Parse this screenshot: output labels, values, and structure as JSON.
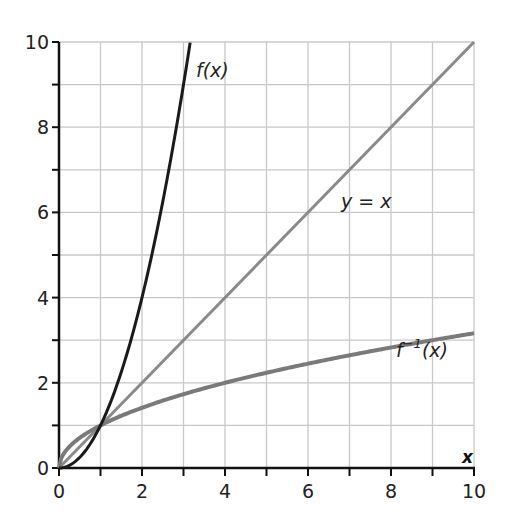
{
  "chart_data": {
    "type": "line",
    "title": "",
    "xlabel": "x",
    "ylabel": "",
    "xlim": [
      0,
      10
    ],
    "ylim": [
      0,
      10
    ],
    "grid": true,
    "grid_step": 1,
    "x_ticks": [
      "0",
      "2",
      "4",
      "6",
      "8",
      "10"
    ],
    "y_ticks": [
      "0",
      "2",
      "4",
      "6",
      "8",
      "10"
    ],
    "series": [
      {
        "name": "f(x)",
        "label": "f(x)",
        "color": "#1a1a1a",
        "formula": "x^2",
        "x": [
          0,
          0.5,
          1,
          1.5,
          2,
          2.5,
          3,
          3.16
        ],
        "values": [
          0,
          0.25,
          1,
          2.25,
          4,
          6.25,
          9,
          10
        ]
      },
      {
        "name": "y = x",
        "label": "y = x",
        "color": "#8a8a8a",
        "formula": "x",
        "x": [
          0,
          10
        ],
        "values": [
          0,
          10
        ]
      },
      {
        "name": "f^-1(x)",
        "label": "f⁻¹(x)",
        "color": "#7a7a7a",
        "formula": "sqrt(x)",
        "x": [
          0,
          0.25,
          1,
          2,
          4,
          6,
          8,
          10
        ],
        "values": [
          0,
          0.5,
          1,
          1.41,
          2,
          2.45,
          2.83,
          3.16
        ]
      }
    ],
    "annotations": [
      {
        "text": "f(x)",
        "x": 3.3,
        "y": 9.5
      },
      {
        "text": "y = x",
        "x": 6.8,
        "y": 6.1
      },
      {
        "text": "f⁻¹(x)",
        "x": 8.1,
        "y": 3.6
      }
    ]
  },
  "labels": {
    "f": "f(x)",
    "identity": "y = x",
    "finv_base": "f",
    "finv_sup": "−1",
    "finv_arg": "(x)",
    "x_axis": "x"
  }
}
